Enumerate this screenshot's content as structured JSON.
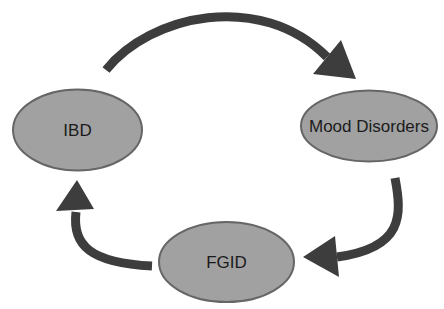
{
  "diagram": {
    "type": "cycle",
    "nodes": [
      {
        "id": "ibd",
        "label": "IBD"
      },
      {
        "id": "mood-disorders",
        "label": "Mood Disorders"
      },
      {
        "id": "fgid",
        "label": "FGID"
      }
    ],
    "edges": [
      {
        "from": "IBD",
        "to": "Mood Disorders"
      },
      {
        "from": "Mood Disorders",
        "to": "FGID"
      },
      {
        "from": "FGID",
        "to": "IBD"
      }
    ]
  },
  "colors": {
    "background": "#ffffff",
    "node_fill": "#a1a1a1",
    "node_stroke": "#666666",
    "label_text": "#1b1b1b",
    "arrow": "#3d3d3d"
  }
}
